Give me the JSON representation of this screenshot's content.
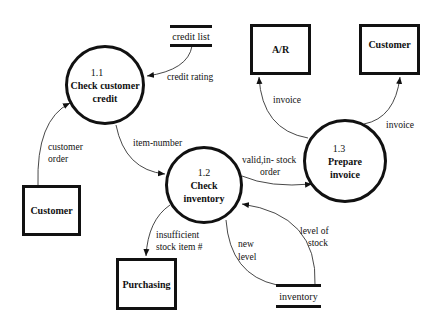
{
  "diagram": {
    "type": "data-flow-diagram",
    "processes": [
      {
        "id": "1.1",
        "name_line1": "Check customer",
        "name_line2": "credit"
      },
      {
        "id": "1.2",
        "name_line1": "Check",
        "name_line2": "inventory"
      },
      {
        "id": "1.3",
        "name_line1": "Prepare",
        "name_line2": "invoice"
      }
    ],
    "entities": {
      "ar": "A/R",
      "customer_top": "Customer",
      "customer_left": "Customer",
      "purchasing": "Purchasing"
    },
    "stores": {
      "credit_list": "credit list",
      "inventory": "inventory"
    },
    "flows": {
      "credit_rating": "credit rating",
      "customer_order_1": "customer",
      "customer_order_2": "order",
      "item_number": "item-number",
      "valid_1": "valid,in- stock",
      "valid_2": "order",
      "invoice_ar": "invoice",
      "invoice_customer": "invoice",
      "insufficient_1": "insufficient",
      "insufficient_2": "stock item #",
      "new_level_1": "new",
      "new_level_2": "level",
      "level_stock_1": "level of",
      "level_stock_2": "stock"
    }
  }
}
